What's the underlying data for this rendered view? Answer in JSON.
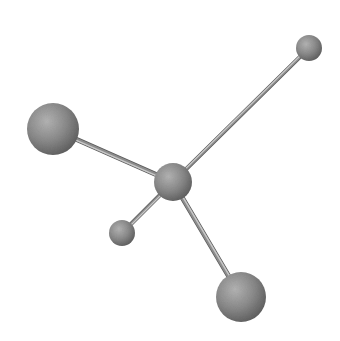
{
  "diagram": {
    "title": "Ball-and-stick molecular model",
    "canvas": {
      "width": 340,
      "height": 341,
      "background": "#ffffff"
    },
    "colors": {
      "atom_light": "#b4b4b4",
      "atom_mid": "#8a8a8a",
      "atom_dark": "#5e5e5e",
      "bond_light": "#c8c8c8",
      "bond_mid": "#8c8c8c",
      "bond_dark": "#5a5a5a"
    },
    "atoms": [
      {
        "id": "center",
        "label": "central atom",
        "cx": 173,
        "cy": 182,
        "r": 19
      },
      {
        "id": "upper-left-large",
        "label": "large atom (upper left)",
        "cx": 53,
        "cy": 129,
        "r": 26
      },
      {
        "id": "lower-right-large",
        "label": "large atom (lower right)",
        "cx": 241,
        "cy": 297,
        "r": 25
      },
      {
        "id": "upper-right-small",
        "label": "small atom (upper right)",
        "cx": 309,
        "cy": 48,
        "r": 13
      },
      {
        "id": "lower-left-small",
        "label": "small atom (lower left)",
        "cx": 122,
        "cy": 233,
        "r": 13
      }
    ],
    "bonds": [
      {
        "from": "center",
        "to": "upper-left-large",
        "width": 5
      },
      {
        "from": "center",
        "to": "upper-right-small",
        "width": 4
      },
      {
        "from": "center",
        "to": "lower-left-small",
        "width": 4
      },
      {
        "from": "center",
        "to": "lower-right-large",
        "width": 5
      }
    ]
  }
}
